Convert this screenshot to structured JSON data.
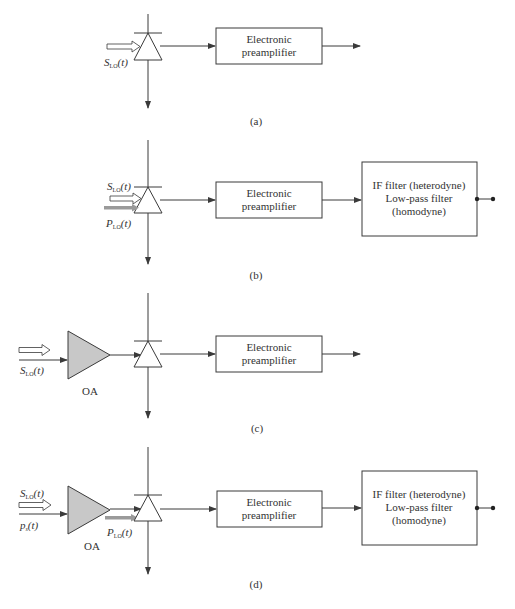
{
  "figure": {
    "colors": {
      "line": "#3a3a3a",
      "amp_fill": "#c8c8c8",
      "lo_arrow": "#9a9a9a",
      "text": "#333333"
    },
    "panels": [
      {
        "id": "a",
        "label": "(a)",
        "inputs": [
          {
            "symbol": "S",
            "sub": "LO",
            "arg": "(t)",
            "arrow": "hollow"
          }
        ],
        "blocks": [
          {
            "name": "preamp",
            "lines": [
              "Electronic",
              "preamplifier"
            ]
          }
        ],
        "output": "arrow"
      },
      {
        "id": "b",
        "label": "(b)",
        "inputs": [
          {
            "symbol": "S",
            "sub": "LO",
            "arg": "(t)",
            "arrow": "hollow"
          },
          {
            "symbol": "P",
            "sub": "LO",
            "arg": "(t)",
            "arrow": "gray"
          }
        ],
        "blocks": [
          {
            "name": "preamp",
            "lines": [
              "Electronic",
              "preamplifier"
            ]
          },
          {
            "name": "if-filter",
            "lines": [
              "IF filter (heterodyne)",
              "Low-pass filter",
              "(homodyne)"
            ]
          }
        ],
        "output": "terminal"
      },
      {
        "id": "c",
        "label": "(c)",
        "inputs": [
          {
            "symbol": "S",
            "sub": "LO",
            "arg": "(t)",
            "arrow": "hollow"
          }
        ],
        "amplifier": {
          "label": "OA"
        },
        "blocks": [
          {
            "name": "preamp",
            "lines": [
              "Electronic",
              "preamplifier"
            ]
          }
        ],
        "output": "arrow"
      },
      {
        "id": "d",
        "label": "(d)",
        "inputs": [
          {
            "symbol": "S",
            "sub": "LO",
            "arg": "(t)",
            "arrow": "hollow"
          },
          {
            "symbol": "p",
            "sub": "s",
            "arg": "(t)",
            "arrow": "solid"
          },
          {
            "symbol": "P",
            "sub": "LO",
            "arg": "(t)",
            "arrow": "gray"
          }
        ],
        "amplifier": {
          "label": "OA"
        },
        "blocks": [
          {
            "name": "preamp",
            "lines": [
              "Electronic",
              "preamplifier"
            ]
          },
          {
            "name": "if-filter",
            "lines": [
              "IF filter (heterodyne)",
              "Low-pass filter",
              "(homodyne)"
            ]
          }
        ],
        "output": "terminal"
      }
    ]
  }
}
